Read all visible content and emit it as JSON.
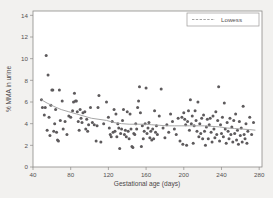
{
  "figure": {
    "background_color": "#f2f1ef",
    "plot_background_color": "#ffffff",
    "frame_color": "#8c8a88"
  },
  "chart_data": {
    "type": "scatter",
    "title": "",
    "subtitle": "",
    "xlabel": "Gestational age (days)",
    "ylabel": "% MMA in urine",
    "xlim": [
      40,
      283
    ],
    "ylim": [
      0,
      14.4
    ],
    "xticks": [
      40,
      80,
      120,
      160,
      200,
      240,
      280
    ],
    "yticks": [
      0,
      2,
      4,
      6,
      8,
      10,
      12,
      14
    ],
    "xtick_labels": [
      "40",
      "80",
      "120",
      "160",
      "200",
      "240",
      "280"
    ],
    "ytick_labels": [
      "0",
      "2",
      "4",
      "6",
      "8",
      "10",
      "12",
      "14"
    ],
    "grid": false,
    "legend": {
      "position": "top-right",
      "entries": [
        {
          "label": "Lowess",
          "style": "dashed-line",
          "color": "#9a9a9a"
        }
      ]
    },
    "marker": {
      "shape": "circle",
      "color": "#5d5a5c",
      "size": 1.5
    },
    "series": [
      {
        "name": "% MMA in urine",
        "type": "scatter",
        "points": [
          [
            49,
            6.2
          ],
          [
            50,
            5.5
          ],
          [
            52,
            4.8
          ],
          [
            53,
            5.5
          ],
          [
            54,
            10.3
          ],
          [
            55,
            3.4
          ],
          [
            56,
            8.5
          ],
          [
            57,
            4.6
          ],
          [
            58,
            2.9
          ],
          [
            59,
            5.7
          ],
          [
            60,
            7.1
          ],
          [
            61,
            7.1
          ],
          [
            62,
            3.3
          ],
          [
            63,
            4.0
          ],
          [
            64,
            5.3
          ],
          [
            65,
            3.2
          ],
          [
            66,
            2.5
          ],
          [
            67,
            2.4
          ],
          [
            68,
            7.1
          ],
          [
            69,
            4.3
          ],
          [
            71,
            6.1
          ],
          [
            72,
            3.5
          ],
          [
            74,
            4.2
          ],
          [
            76,
            3.0
          ],
          [
            78,
            4.7
          ],
          [
            80,
            4.6
          ],
          [
            82,
            5.2
          ],
          [
            83,
            6.0
          ],
          [
            84,
            6.8
          ],
          [
            85,
            6.1
          ],
          [
            86,
            6.1
          ],
          [
            87,
            5.1
          ],
          [
            88,
            4.2
          ],
          [
            89,
            3.4
          ],
          [
            90,
            5.3
          ],
          [
            91,
            4.5
          ],
          [
            92,
            4.1
          ],
          [
            93,
            5.0
          ],
          [
            95,
            5.1
          ],
          [
            96,
            3.5
          ],
          [
            97,
            4.4
          ],
          [
            98,
            3.3
          ],
          [
            99,
            3.9
          ],
          [
            101,
            5.5
          ],
          [
            103,
            4.1
          ],
          [
            105,
            3.9
          ],
          [
            107,
            2.4
          ],
          [
            108,
            3.8
          ],
          [
            109,
            5.5
          ],
          [
            110,
            6.6
          ],
          [
            112,
            2.3
          ],
          [
            115,
            4.0
          ],
          [
            118,
            6.0
          ],
          [
            120,
            4.6
          ],
          [
            121,
            3.6
          ],
          [
            122,
            3.0
          ],
          [
            123,
            2.8
          ],
          [
            124,
            4.2
          ],
          [
            125,
            3.2
          ],
          [
            126,
            5.3
          ],
          [
            127,
            3.3
          ],
          [
            128,
            4.9
          ],
          [
            129,
            2.8
          ],
          [
            130,
            4.0
          ],
          [
            131,
            3.6
          ],
          [
            132,
            1.7
          ],
          [
            133,
            3.1
          ],
          [
            134,
            3.5
          ],
          [
            135,
            4.3
          ],
          [
            136,
            5.3
          ],
          [
            137,
            3.0
          ],
          [
            138,
            3.4
          ],
          [
            139,
            2.8
          ],
          [
            140,
            5.1
          ],
          [
            141,
            3.3
          ],
          [
            142,
            2.6
          ],
          [
            143,
            4.9
          ],
          [
            144,
            3.5
          ],
          [
            145,
            1.9
          ],
          [
            146,
            1.8
          ],
          [
            147,
            3.1
          ],
          [
            148,
            3.0
          ],
          [
            149,
            4.0
          ],
          [
            150,
            3.5
          ],
          [
            151,
            5.5
          ],
          [
            152,
            6.1
          ],
          [
            153,
            7.4
          ],
          [
            154,
            5.0
          ],
          [
            155,
            1.9
          ],
          [
            156,
            3.8
          ],
          [
            157,
            2.6
          ],
          [
            158,
            3.3
          ],
          [
            159,
            4.0
          ],
          [
            160,
            7.3
          ],
          [
            161,
            3.1
          ],
          [
            162,
            3.6
          ],
          [
            163,
            4.1
          ],
          [
            164,
            2.7
          ],
          [
            165,
            3.3
          ],
          [
            166,
            2.5
          ],
          [
            167,
            3.5
          ],
          [
            168,
            2.6
          ],
          [
            169,
            5.2
          ],
          [
            170,
            3.2
          ],
          [
            171,
            3.8
          ],
          [
            172,
            3.0
          ],
          [
            174,
            4.7
          ],
          [
            176,
            7.2
          ],
          [
            178,
            3.6
          ],
          [
            180,
            2.7
          ],
          [
            182,
            3.9
          ],
          [
            184,
            3.2
          ],
          [
            186,
            4.9
          ],
          [
            188,
            4.2
          ],
          [
            190,
            3.5
          ],
          [
            192,
            3.0
          ],
          [
            194,
            4.5
          ],
          [
            196,
            2.4
          ],
          [
            198,
            4.6
          ],
          [
            199,
            2.1
          ],
          [
            200,
            5.0
          ],
          [
            201,
            4.4
          ],
          [
            202,
            3.9
          ],
          [
            203,
            2.0
          ],
          [
            204,
            4.2
          ],
          [
            205,
            5.2
          ],
          [
            206,
            3.4
          ],
          [
            207,
            6.2
          ],
          [
            208,
            4.0
          ],
          [
            209,
            4.7
          ],
          [
            210,
            2.2
          ],
          [
            211,
            3.8
          ],
          [
            212,
            5.2
          ],
          [
            213,
            4.3
          ],
          [
            214,
            3.3
          ],
          [
            215,
            6.0
          ],
          [
            216,
            2.8
          ],
          [
            217,
            4.0
          ],
          [
            218,
            3.1
          ],
          [
            219,
            4.5
          ],
          [
            220,
            2.6
          ],
          [
            221,
            4.8
          ],
          [
            222,
            3.3
          ],
          [
            223,
            2.0
          ],
          [
            224,
            3.7
          ],
          [
            225,
            4.4
          ],
          [
            226,
            2.6
          ],
          [
            227,
            3.9
          ],
          [
            228,
            4.5
          ],
          [
            229,
            3.2
          ],
          [
            230,
            2.3
          ],
          [
            231,
            4.7
          ],
          [
            232,
            3.5
          ],
          [
            233,
            2.7
          ],
          [
            234,
            5.1
          ],
          [
            235,
            3.0
          ],
          [
            236,
            4.3
          ],
          [
            237,
            7.4
          ],
          [
            238,
            2.4
          ],
          [
            239,
            3.9
          ],
          [
            240,
            3.1
          ],
          [
            241,
            4.6
          ],
          [
            242,
            2.8
          ],
          [
            243,
            5.9
          ],
          [
            244,
            3.5
          ],
          [
            245,
            2.2
          ],
          [
            246,
            4.1
          ],
          [
            247,
            3.3
          ],
          [
            248,
            2.6
          ],
          [
            249,
            4.5
          ],
          [
            250,
            3.0
          ],
          [
            251,
            3.7
          ],
          [
            252,
            2.3
          ],
          [
            253,
            4.3
          ],
          [
            254,
            3.1
          ],
          [
            255,
            4.9
          ],
          [
            256,
            2.5
          ],
          [
            257,
            3.4
          ],
          [
            258,
            2.1
          ],
          [
            259,
            4.2
          ],
          [
            260,
            2.9
          ],
          [
            261,
            3.6
          ],
          [
            262,
            2.3
          ],
          [
            263,
            5.6
          ],
          [
            264,
            3.0
          ],
          [
            265,
            2.6
          ],
          [
            266,
            4.0
          ],
          [
            267,
            2.2
          ],
          [
            268,
            3.3
          ],
          [
            270,
            4.6
          ],
          [
            272,
            3.0
          ],
          [
            274,
            4.1
          ]
        ]
      },
      {
        "name": "Lowess",
        "type": "line",
        "color": "#a6a6a6",
        "points": [
          [
            49,
            6.2
          ],
          [
            55,
            5.9
          ],
          [
            62,
            5.6
          ],
          [
            70,
            5.3
          ],
          [
            78,
            5.1
          ],
          [
            86,
            4.9
          ],
          [
            94,
            4.7
          ],
          [
            102,
            4.5
          ],
          [
            110,
            4.4
          ],
          [
            118,
            4.3
          ],
          [
            126,
            4.1
          ],
          [
            134,
            4.0
          ],
          [
            142,
            3.95
          ],
          [
            150,
            3.95
          ],
          [
            158,
            3.95
          ],
          [
            166,
            3.9
          ],
          [
            174,
            3.85
          ],
          [
            182,
            3.8
          ],
          [
            190,
            3.8
          ],
          [
            198,
            3.8
          ],
          [
            206,
            3.8
          ],
          [
            214,
            3.8
          ],
          [
            222,
            3.8
          ],
          [
            230,
            3.75
          ],
          [
            238,
            3.7
          ],
          [
            246,
            3.6
          ],
          [
            254,
            3.55
          ],
          [
            262,
            3.5
          ],
          [
            270,
            3.45
          ],
          [
            276,
            3.4
          ]
        ]
      }
    ]
  }
}
